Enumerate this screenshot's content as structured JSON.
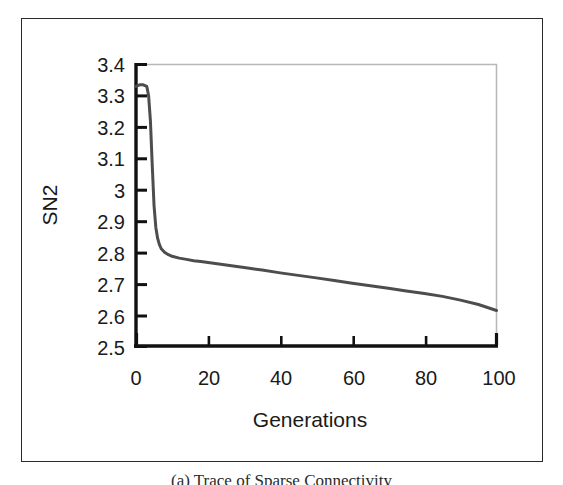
{
  "figure": {
    "caption": "(a) Trace of Sparse Connectivity",
    "frame_color": "#2b2b2b"
  },
  "chart_data": {
    "type": "line",
    "title": "",
    "subtitle": "",
    "xlabel": "Generations",
    "ylabel": "SN2",
    "xlim": [
      0,
      100
    ],
    "ylim": [
      2.5,
      3.4
    ],
    "grid": false,
    "legend": null,
    "legend_position": "none",
    "line_color": "#4d4d4d",
    "line_width": 3,
    "axis_color": "#111111",
    "frame_top_right_color": "#b8b8b8",
    "x_ticks": [
      0,
      20,
      40,
      60,
      80,
      100
    ],
    "x_tick_labels": [
      "0",
      "20",
      "40",
      "60",
      "80",
      "100"
    ],
    "y_ticks": [
      2.5,
      2.6,
      2.7,
      2.8,
      2.9,
      3.0,
      3.1,
      3.2,
      3.3,
      3.4
    ],
    "y_tick_labels": [
      "2.5",
      "2.6",
      "2.7",
      "2.8",
      "2.9",
      "3",
      "3.1",
      "3.2",
      "3.3",
      "3.4"
    ],
    "tick_direction": "in",
    "series": [
      {
        "name": "SN2",
        "x": [
          0,
          1,
          2,
          3,
          3.5,
          4,
          4.5,
          5,
          5.5,
          6,
          6.5,
          7,
          8,
          9,
          10,
          12,
          14,
          16,
          18,
          20,
          25,
          30,
          35,
          40,
          45,
          50,
          55,
          60,
          65,
          70,
          75,
          80,
          85,
          90,
          95,
          100
        ],
        "y": [
          3.33,
          3.335,
          3.335,
          3.33,
          3.3,
          3.22,
          3.08,
          2.95,
          2.88,
          2.845,
          2.825,
          2.812,
          2.8,
          2.793,
          2.788,
          2.782,
          2.778,
          2.774,
          2.771,
          2.768,
          2.76,
          2.752,
          2.744,
          2.735,
          2.727,
          2.719,
          2.711,
          2.702,
          2.694,
          2.686,
          2.677,
          2.669,
          2.66,
          2.648,
          2.634,
          2.615
        ]
      }
    ]
  }
}
